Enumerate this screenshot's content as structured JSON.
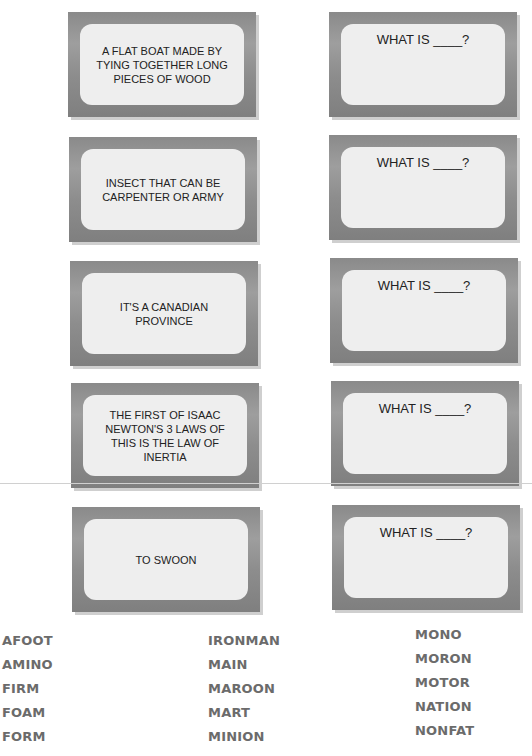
{
  "clue_cards": [
    {
      "text": "A FLAT BOAT MADE BY TYING TOGETHER LONG PIECES OF WOOD"
    },
    {
      "text": "INSECT THAT CAN BE CARPENTER OR ARMY"
    },
    {
      "text": "IT'S A CANADIAN PROVINCE"
    },
    {
      "text": "THE FIRST OF ISAAC NEWTON'S 3 LAWS OF THIS IS THE LAW OF INERTIA"
    },
    {
      "text": "TO SWOON"
    }
  ],
  "answer_cards": [
    {
      "prompt": "WHAT IS ____?"
    },
    {
      "prompt": "WHAT IS ____?"
    },
    {
      "prompt": "WHAT IS ____?"
    },
    {
      "prompt": "WHAT IS ____?"
    },
    {
      "prompt": "WHAT IS ____?"
    }
  ],
  "word_bank": {
    "col1": [
      "AFOOT",
      "AMINO",
      "FIRM",
      "FOAM",
      "FORM"
    ],
    "col2": [
      "IRONMAN",
      "MAIN",
      "MAROON",
      "MART",
      "MINION"
    ],
    "col3": [
      "MONO",
      "MORON",
      "MOTOR",
      "NATION",
      "NONFAT"
    ]
  }
}
